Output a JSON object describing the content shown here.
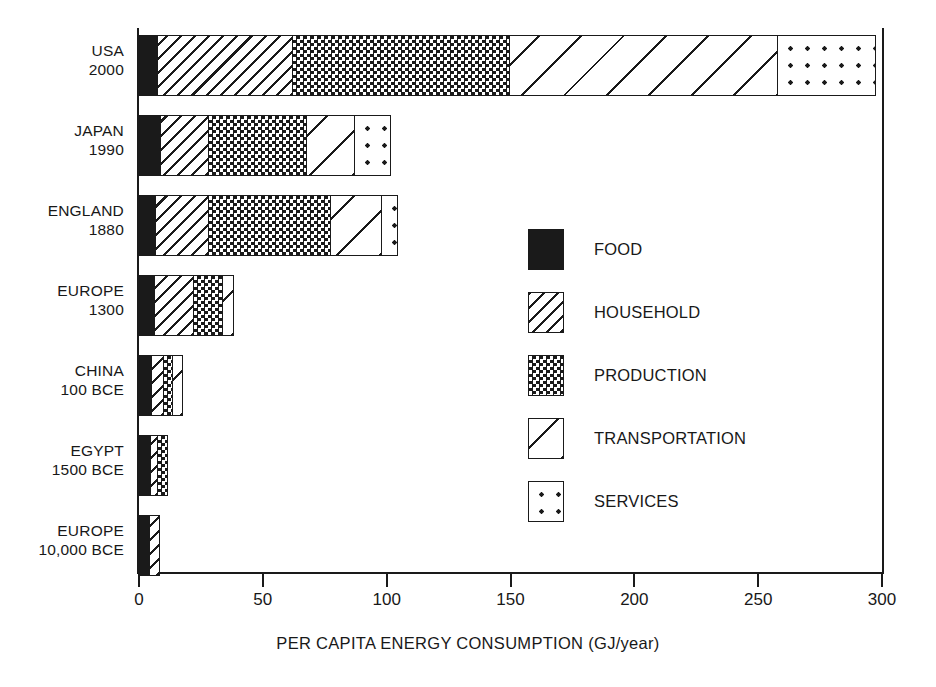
{
  "chart_data": {
    "type": "bar",
    "orientation": "horizontal",
    "stacked": true,
    "title": "",
    "xlabel": "PER CAPITA ENERGY CONSUMPTION (GJ/year)",
    "ylabel": "",
    "xlim": [
      0,
      300
    ],
    "xticks": [
      0,
      50,
      100,
      150,
      200,
      250,
      300
    ],
    "xtick_labels": [
      "0",
      "50",
      "100",
      "150",
      "200",
      "250",
      "300"
    ],
    "grid": false,
    "legend_position": "center-right",
    "categories": [
      "USA\n2000",
      "JAPAN\n1990",
      "ENGLAND\n1880",
      "EUROPE\n1300",
      "CHINA\n100 BCE",
      "EGYPT\n1500 BCE",
      "EUROPE\n10,000 BCE"
    ],
    "category_rows": [
      {
        "place": "USA",
        "period": "2000"
      },
      {
        "place": "JAPAN",
        "period": "1990"
      },
      {
        "place": "ENGLAND",
        "period": "1880"
      },
      {
        "place": "EUROPE",
        "period": "1300"
      },
      {
        "place": "CHINA",
        "period": "100 BCE"
      },
      {
        "place": "EGYPT",
        "period": "1500 BCE"
      },
      {
        "place": "EUROPE",
        "period": "10,000 BCE"
      }
    ],
    "series": [
      {
        "name": "FOOD",
        "pattern": "solid-black",
        "values": [
          8,
          9,
          7,
          6.5,
          5.5,
          5,
          4.5
        ]
      },
      {
        "name": "HOUSEHOLD",
        "pattern": "dense-hatch",
        "values": [
          55,
          20,
          22,
          16.5,
          5.5,
          3.5,
          4.5
        ]
      },
      {
        "name": "PRODUCTION",
        "pattern": "checkerboard",
        "values": [
          88,
          40,
          50,
          12,
          4,
          4.5,
          0
        ]
      },
      {
        "name": "TRANSPORTATION",
        "pattern": "sparse-hatch",
        "values": [
          109,
          20,
          21,
          5,
          4.5,
          0,
          0
        ]
      },
      {
        "name": "SERVICES",
        "pattern": "dots",
        "values": [
          40,
          15,
          7,
          0,
          0,
          0,
          0
        ]
      }
    ],
    "totals": [
      300,
      104,
      107,
      40,
      19.5,
      13,
      9
    ]
  },
  "legend": {
    "items": [
      {
        "label": "FOOD",
        "icon": "solid-black-swatch"
      },
      {
        "label": "HOUSEHOLD",
        "icon": "dense-hatch-swatch"
      },
      {
        "label": "PRODUCTION",
        "icon": "checkerboard-swatch"
      },
      {
        "label": "TRANSPORTATION",
        "icon": "sparse-hatch-swatch"
      },
      {
        "label": "SERVICES",
        "icon": "dots-swatch"
      }
    ]
  }
}
